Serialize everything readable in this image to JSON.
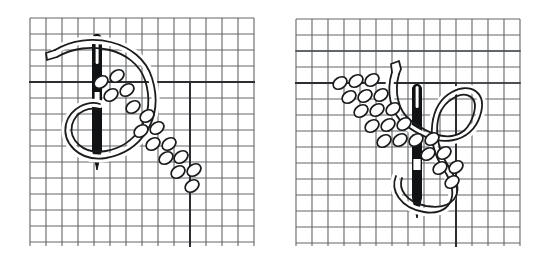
{
  "figure": {
    "background_color": "#ffffff",
    "panel_count": 2
  },
  "style": {
    "grid_line_color": "#55585c",
    "grid_line_color_light": "#7c7f84",
    "emphasis_line_color": "#2b2d30",
    "needle_color": "#111214",
    "outline_color": "#1a1b1d",
    "bead_fill": "#ffffff",
    "thread_fill": "#ffffff",
    "grid_step_px": 16,
    "grid_line_width": 1.1,
    "emphasis_line_width": 2.0,
    "outline_width": 2.0
  },
  "panels": [
    {
      "id": "panel-left",
      "name": "left-panel",
      "label": "Step 1 - needle entering fabric, beads trailing down-right",
      "grid": {
        "x": 30,
        "y": 18,
        "width": 224,
        "height": 228,
        "cols": 14,
        "rows": 14,
        "step": 16
      },
      "emphasis_lines": [
        {
          "name": "guide-line-horizontal",
          "x1": 30,
          "y1": 82,
          "x2": 190,
          "y2": 82
        },
        {
          "name": "guide-line-horizontal-right",
          "x1": 190,
          "y1": 82,
          "x2": 254,
          "y2": 82
        },
        {
          "name": "guide-line-vertical",
          "x1": 190,
          "y1": 82,
          "x2": 190,
          "y2": 246
        }
      ],
      "needle": {
        "name": "sewing-needle",
        "x": 97,
        "top": 30,
        "bottom": 170,
        "width": 9,
        "eye": {
          "y": 38,
          "height": 26,
          "width": 3
        }
      },
      "beads": [
        {
          "cx": 101,
          "cy": 82,
          "rx": 7.5,
          "ry": 5.5,
          "angle": -35
        },
        {
          "cx": 117,
          "cy": 76,
          "rx": 7.5,
          "ry": 5.5,
          "angle": -35
        },
        {
          "cx": 111,
          "cy": 95,
          "rx": 7.5,
          "ry": 5.5,
          "angle": -35
        },
        {
          "cx": 127,
          "cy": 90,
          "rx": 7.5,
          "ry": 5.5,
          "angle": -35
        },
        {
          "cx": 133,
          "cy": 107,
          "rx": 7.5,
          "ry": 5.5,
          "angle": -35
        },
        {
          "cx": 147,
          "cy": 116,
          "rx": 7.5,
          "ry": 5.5,
          "angle": -35
        },
        {
          "cx": 141,
          "cy": 131,
          "rx": 7.5,
          "ry": 5.5,
          "angle": -35
        },
        {
          "cx": 157,
          "cy": 128,
          "rx": 7.5,
          "ry": 5.5,
          "angle": -35
        },
        {
          "cx": 153,
          "cy": 144,
          "rx": 7.5,
          "ry": 5.5,
          "angle": -35
        },
        {
          "cx": 169,
          "cy": 144,
          "rx": 7.5,
          "ry": 5.5,
          "angle": -35
        },
        {
          "cx": 166,
          "cy": 158,
          "rx": 7.5,
          "ry": 5.5,
          "angle": -35
        },
        {
          "cx": 181,
          "cy": 157,
          "rx": 7.5,
          "ry": 5.5,
          "angle": -35
        },
        {
          "cx": 178,
          "cy": 172,
          "rx": 7.5,
          "ry": 5.5,
          "angle": -35
        },
        {
          "cx": 194,
          "cy": 170,
          "rx": 7.5,
          "ry": 5.5,
          "angle": -35
        },
        {
          "cx": 192,
          "cy": 186,
          "rx": 7.5,
          "ry": 5.5,
          "angle": -35
        }
      ],
      "thread": {
        "name": "thread-loop",
        "description": "Large C-shaped thread loop opening to the left, with a tail curving up and off to the upper left"
      }
    },
    {
      "id": "panel-right",
      "name": "right-panel",
      "label": "Step 2 - needle pulled through, bead row running up-left",
      "grid": {
        "x": 296,
        "y": 19,
        "width": 224,
        "height": 227,
        "cols": 14,
        "rows": 14,
        "step": 16
      },
      "emphasis_lines": [
        {
          "name": "guide-line-horizontal",
          "x1": 296,
          "y1": 83,
          "x2": 456,
          "y2": 83
        },
        {
          "name": "guide-line-horizontal-faint",
          "x1": 296,
          "y1": 51,
          "x2": 520,
          "y2": 51
        },
        {
          "name": "guide-line-vertical",
          "x1": 456,
          "y1": 83,
          "x2": 456,
          "y2": 246
        }
      ],
      "needle": {
        "name": "sewing-needle",
        "x": 417,
        "top": 80,
        "bottom": 218,
        "width": 9,
        "eye": {
          "y": 160,
          "height": 16,
          "width": 6
        }
      },
      "beads": [
        {
          "cx": 340,
          "cy": 83,
          "rx": 7.5,
          "ry": 5.5,
          "angle": -35
        },
        {
          "cx": 356,
          "cy": 81,
          "rx": 7.5,
          "ry": 5.5,
          "angle": -35
        },
        {
          "cx": 372,
          "cy": 80,
          "rx": 7.5,
          "ry": 5.5,
          "angle": -35
        },
        {
          "cx": 349,
          "cy": 97,
          "rx": 7.5,
          "ry": 5.5,
          "angle": -35
        },
        {
          "cx": 365,
          "cy": 96,
          "rx": 7.5,
          "ry": 5.5,
          "angle": -35
        },
        {
          "cx": 381,
          "cy": 95,
          "rx": 7.5,
          "ry": 5.5,
          "angle": -35
        },
        {
          "cx": 361,
          "cy": 111,
          "rx": 7.5,
          "ry": 5.5,
          "angle": -35
        },
        {
          "cx": 377,
          "cy": 110,
          "rx": 7.5,
          "ry": 5.5,
          "angle": -35
        },
        {
          "cx": 393,
          "cy": 109,
          "rx": 7.5,
          "ry": 5.5,
          "angle": -35
        },
        {
          "cx": 372,
          "cy": 126,
          "rx": 7.5,
          "ry": 5.5,
          "angle": -35
        },
        {
          "cx": 388,
          "cy": 125,
          "rx": 7.5,
          "ry": 5.5,
          "angle": -35
        },
        {
          "cx": 404,
          "cy": 124,
          "rx": 7.5,
          "ry": 5.5,
          "angle": -35
        },
        {
          "cx": 384,
          "cy": 141,
          "rx": 7.5,
          "ry": 5.5,
          "angle": -35
        },
        {
          "cx": 400,
          "cy": 140,
          "rx": 7.5,
          "ry": 5.5,
          "angle": -35
        },
        {
          "cx": 416,
          "cy": 140,
          "rx": 7.5,
          "ry": 5.5,
          "angle": -35
        },
        {
          "cx": 432,
          "cy": 139,
          "rx": 7.5,
          "ry": 5.5,
          "angle": -35
        },
        {
          "cx": 428,
          "cy": 154,
          "rx": 7.5,
          "ry": 5.5,
          "angle": -35
        },
        {
          "cx": 444,
          "cy": 153,
          "rx": 7.5,
          "ry": 5.5,
          "angle": -35
        },
        {
          "cx": 440,
          "cy": 168,
          "rx": 7.5,
          "ry": 5.5,
          "angle": -35
        },
        {
          "cx": 456,
          "cy": 167,
          "rx": 7.5,
          "ry": 5.5,
          "angle": -35
        },
        {
          "cx": 452,
          "cy": 182,
          "rx": 7.5,
          "ry": 5.5,
          "angle": -35
        }
      ],
      "thread": {
        "name": "thread-loop",
        "description": "Long teardrop thread loop sweeping right and down around the needle, with a small hook tail at the top"
      }
    }
  ]
}
